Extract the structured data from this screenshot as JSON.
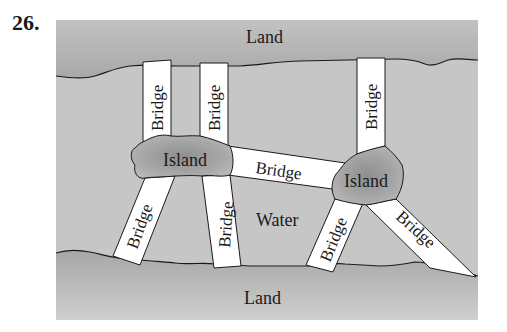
{
  "problem_number": "26.",
  "labels": {
    "land_top": "Land",
    "land_bottom": "Land",
    "water": "Water",
    "island_left": "Island",
    "island_right": "Island",
    "bridge": "Bridge"
  },
  "bridges": [
    {
      "id": "b1",
      "label": "Bridge",
      "connects": [
        "land_top",
        "island_left"
      ]
    },
    {
      "id": "b2",
      "label": "Bridge",
      "connects": [
        "land_top",
        "island_left"
      ]
    },
    {
      "id": "b3",
      "label": "Bridge",
      "connects": [
        "land_top",
        "island_right"
      ]
    },
    {
      "id": "b4",
      "label": "Bridge",
      "connects": [
        "island_left",
        "island_right"
      ]
    },
    {
      "id": "b5",
      "label": "Bridge",
      "connects": [
        "island_left",
        "land_bottom"
      ]
    },
    {
      "id": "b6",
      "label": "Bridge",
      "connects": [
        "island_left",
        "land_bottom"
      ]
    },
    {
      "id": "b7",
      "label": "Bridge",
      "connects": [
        "island_right",
        "land_bottom"
      ]
    },
    {
      "id": "b8",
      "label": "Bridge",
      "connects": [
        "island_right",
        "land_bottom"
      ]
    }
  ],
  "colors": {
    "land": "#b4b4b4",
    "water": "#c6c6c6",
    "island": "#a6a6a6",
    "bridge": "#ffffff",
    "outline": "#1a1a1a"
  }
}
